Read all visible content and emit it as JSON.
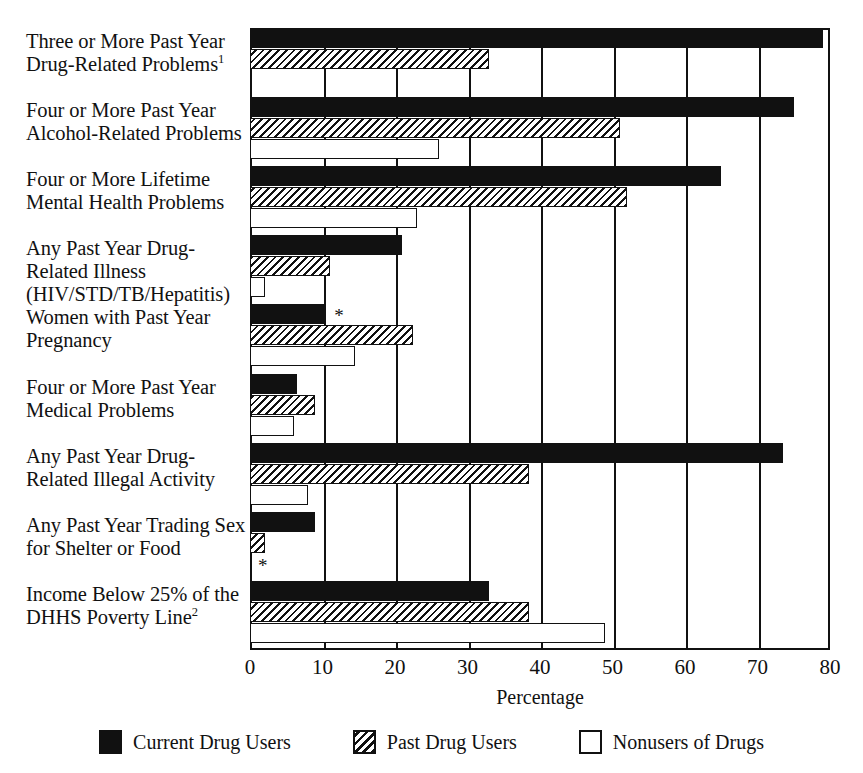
{
  "chart_data": {
    "type": "bar",
    "orientation": "horizontal",
    "title": "",
    "xlabel": "Percentage",
    "ylabel": "",
    "xlim": [
      0,
      80
    ],
    "xticks": [
      0,
      10,
      20,
      30,
      40,
      50,
      60,
      70,
      80
    ],
    "xtick_labels": [
      "0",
      "10",
      "20",
      "30",
      "40",
      "50",
      "60",
      "70",
      "80"
    ],
    "grid": true,
    "grid_axis": "x",
    "legend_position": "bottom",
    "categories": [
      "Three or More Past Year Drug-Related Problems",
      "Four or More Past Year Alcohol-Related Problems",
      "Four or More Lifetime Mental Health Problems",
      "Any Past Year Drug-Related Illness (HIV/STD/TB/Hepatitis)",
      "Women with Past Year Pregnancy",
      "Four or More Past Year Medical Problems",
      "Any Past Year Drug-Related Illegal Activity",
      "Any Past Year Trading Sex for Shelter or Food",
      "Income Below 25% of the DHHS Poverty Line"
    ],
    "category_footnotes": [
      "1",
      "",
      "",
      "",
      "",
      "",
      "",
      "",
      "2"
    ],
    "series": [
      {
        "name": "Current Drug Users",
        "fill": "black",
        "color": "#111111",
        "values": [
          79,
          75,
          65,
          21,
          10.5,
          6.5,
          73.5,
          9,
          33
        ]
      },
      {
        "name": "Past Drug Users",
        "fill": "hatched",
        "color": "#111111",
        "values": [
          33,
          51,
          52,
          11,
          22.5,
          9,
          38.5,
          2,
          38.5
        ]
      },
      {
        "name": "Nonusers of Drugs",
        "fill": "white",
        "color": "#ffffff",
        "values": [
          null,
          26,
          23,
          2,
          14.5,
          6,
          8,
          0,
          49
        ]
      }
    ],
    "annotations": [
      {
        "symbol": "*",
        "category_index": 4,
        "series_index": 0,
        "note": "asterisk beside Current Drug Users bar for Women with Past Year Pregnancy"
      },
      {
        "symbol": "*",
        "category_index": 7,
        "series_index": 2,
        "note": "asterisk beside Nonusers of Drugs bar for Any Past Year Trading Sex for Shelter or Food"
      }
    ]
  },
  "legend": {
    "items": [
      {
        "label": "Current Drug Users",
        "fill": "black"
      },
      {
        "label": "Past Drug Users",
        "fill": "hatch"
      },
      {
        "label": "Nonusers of Drugs",
        "fill": "white"
      }
    ]
  },
  "axis": {
    "x_title": "Percentage"
  }
}
